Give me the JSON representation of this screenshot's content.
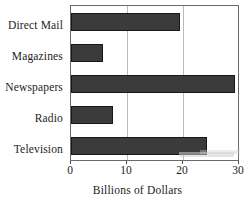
{
  "chart_data": {
    "type": "bar",
    "orientation": "horizontal",
    "title": "",
    "xlabel": "Billions of Dollars",
    "ylabel": "",
    "categories": [
      "Direct Mail",
      "Magazines",
      "Newspapers",
      "Radio",
      "Television"
    ],
    "values": [
      19.5,
      5.7,
      29.5,
      7.5,
      24.5
    ],
    "xlim": [
      0,
      30
    ],
    "xticks": [
      0,
      10,
      20,
      30
    ],
    "xtick_labels": [
      "0",
      "10",
      "20",
      "30"
    ],
    "grid": "vertical gridlines at 10 and 20",
    "legend": "none",
    "bar_color": "#3b3b3b",
    "bar_edge_color": "#171717",
    "frame_color": "#6b6b6b",
    "gridline_color": "#b9b9b9"
  },
  "axis": {
    "xlabel": "Billions of Dollars",
    "ticks": [
      {
        "label": "0",
        "value": 0
      },
      {
        "label": "10",
        "value": 10
      },
      {
        "label": "20",
        "value": 20
      },
      {
        "label": "30",
        "value": 30
      }
    ]
  },
  "bars": [
    {
      "label": "Direct Mail",
      "value": 19.5
    },
    {
      "label": "Magazines",
      "value": 5.7
    },
    {
      "label": "Newspapers",
      "value": 29.5
    },
    {
      "label": "Radio",
      "value": 7.5
    },
    {
      "label": "Television",
      "value": 24.5
    }
  ]
}
